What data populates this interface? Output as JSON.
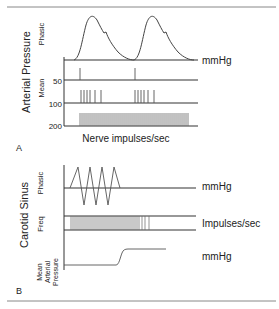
{
  "panel_a": {
    "label": "A",
    "group_title": "Arterial Pressure",
    "row_labels": {
      "phasic": "Phasic",
      "mean": "Mean"
    },
    "ticks": [
      "50",
      "100",
      "200"
    ],
    "unit_right": "mmHg",
    "x_label": "Nerve impulses/sec"
  },
  "panel_b": {
    "label": "B",
    "group_title": "Carotid Sinus",
    "row_labels": {
      "phasic": "Phasic",
      "freq": "Freq",
      "map_line1": "Mean",
      "map_line2": "Arterial",
      "map_line3": "Pressure"
    },
    "units": {
      "phasic": "mmHg",
      "freq": "Impulses/sec",
      "map": "mmHg"
    }
  },
  "colors": {
    "line": "#333333",
    "rule": "#888888",
    "text": "#222222"
  }
}
